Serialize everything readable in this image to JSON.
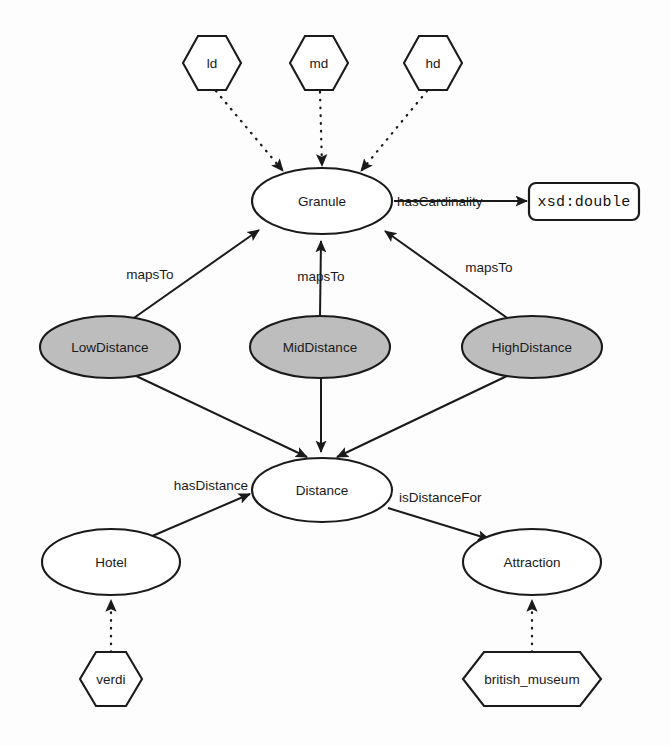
{
  "diagram": {
    "canvas": {
      "width": 670,
      "height": 746
    },
    "colors": {
      "stroke": "#1a1a1a",
      "background": "#fdfdfd",
      "class_fill": "#ffffff",
      "granularity_fill": "#bdbdbd",
      "datatype_fill": "#ffffff"
    }
  },
  "nodes": {
    "instance_ld": {
      "label": "ld",
      "shape": "hexagon"
    },
    "instance_md": {
      "label": "md",
      "shape": "hexagon"
    },
    "instance_hd": {
      "label": "hd",
      "shape": "hexagon"
    },
    "class_granule": {
      "label": "Granule",
      "shape": "ellipse"
    },
    "datatype_double": {
      "label": "xsd:double",
      "shape": "rounded-rect"
    },
    "class_lowdistance": {
      "label": "LowDistance",
      "shape": "ellipse-shaded"
    },
    "class_middistance": {
      "label": "MidDistance",
      "shape": "ellipse-shaded"
    },
    "class_highdistance": {
      "label": "HighDistance",
      "shape": "ellipse-shaded"
    },
    "class_distance": {
      "label": "Distance",
      "shape": "ellipse"
    },
    "class_hotel": {
      "label": "Hotel",
      "shape": "ellipse"
    },
    "class_attraction": {
      "label": "Attraction",
      "shape": "ellipse"
    },
    "instance_verdi": {
      "label": "verdi",
      "shape": "hexagon"
    },
    "instance_british_museum": {
      "label": "british_museum",
      "shape": "hexagon"
    }
  },
  "edges": {
    "ld_granule": {
      "label": "",
      "style": "dotted",
      "from": "ld",
      "to": "Granule"
    },
    "md_granule": {
      "label": "",
      "style": "dotted",
      "from": "md",
      "to": "Granule"
    },
    "hd_granule": {
      "label": "",
      "style": "dotted",
      "from": "hd",
      "to": "Granule"
    },
    "granule_double": {
      "label": "hasCardinality",
      "style": "solid",
      "from": "Granule",
      "to": "xsd:double"
    },
    "low_granule": {
      "label": "mapsTo",
      "style": "solid",
      "from": "LowDistance",
      "to": "Granule"
    },
    "mid_granule": {
      "label": "mapsTo",
      "style": "solid",
      "from": "MidDistance",
      "to": "Granule"
    },
    "high_granule": {
      "label": "mapsTo",
      "style": "solid",
      "from": "HighDistance",
      "to": "Granule"
    },
    "low_distance": {
      "label": "",
      "style": "solid",
      "from": "LowDistance",
      "to": "Distance"
    },
    "mid_distance": {
      "label": "",
      "style": "solid",
      "from": "MidDistance",
      "to": "Distance"
    },
    "high_distance": {
      "label": "",
      "style": "solid",
      "from": "HighDistance",
      "to": "Distance"
    },
    "hotel_distance": {
      "label": "hasDistance",
      "style": "solid",
      "from": "Hotel",
      "to": "Distance"
    },
    "distance_attraction": {
      "label": "isDistanceFor",
      "style": "solid",
      "from": "Distance",
      "to": "Attraction"
    },
    "verdi_hotel": {
      "label": "",
      "style": "dotted",
      "from": "verdi",
      "to": "Hotel"
    },
    "museum_attraction": {
      "label": "",
      "style": "dotted",
      "from": "british_museum",
      "to": "Attraction"
    }
  }
}
